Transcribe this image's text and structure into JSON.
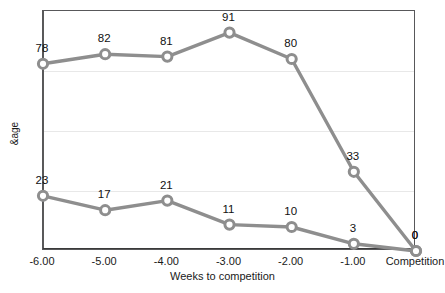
{
  "figure": {
    "clipped_header_text": "",
    "background": "#ffffff",
    "line_color": "#8e8e8e",
    "marker_fill": "#ffffff",
    "grid_color": "#e8e8e8",
    "frame_color": "#58585a"
  },
  "axes": {
    "y_label": "&age",
    "x_label": "Weeks to competition",
    "y_ticks": [
      "0",
      "25",
      "50",
      "75",
      "100"
    ],
    "x_ticks": [
      "-6.00",
      "-5.00",
      "-4.00",
      "-3.00",
      "-2.00",
      "-1.00",
      "Competition"
    ]
  },
  "chart_data": {
    "type": "line",
    "title": "",
    "xlabel": "Weeks to competition",
    "ylabel": "&age",
    "categories": [
      "-6.00",
      "-5.00",
      "-4.00",
      "-3.00",
      "-2.00",
      "-1.00",
      "Competition"
    ],
    "x": [
      -6,
      -5,
      -4,
      -3,
      -2,
      -1,
      0
    ],
    "ylim": [
      0,
      100
    ],
    "xlim": [
      -6,
      0
    ],
    "grid": true,
    "grid_axis": "y",
    "legend": "none",
    "series": [
      {
        "name": "upper-series",
        "color": "#8e8e8e",
        "marker": "circle",
        "values": [
          78,
          82,
          81,
          91,
          80,
          33,
          0
        ],
        "labels": [
          "78",
          "82",
          "81",
          "91",
          "80",
          "33",
          "0"
        ]
      },
      {
        "name": "lower-series",
        "color": "#8e8e8e",
        "marker": "circle",
        "values": [
          23,
          17,
          21,
          11,
          10,
          3,
          0
        ],
        "labels": [
          "23",
          "17",
          "21",
          "11",
          "10",
          "3",
          "0"
        ]
      }
    ],
    "y_ticks": [
      0,
      25,
      50,
      75,
      100
    ],
    "gridlines_at": [
      25,
      50,
      75,
      100
    ]
  }
}
